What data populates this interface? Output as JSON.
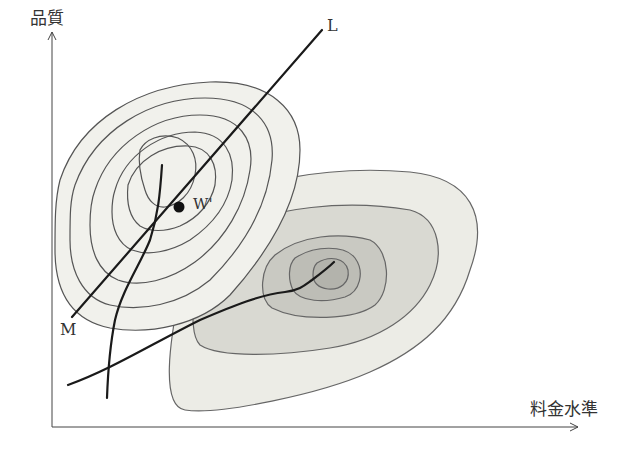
{
  "diagram": {
    "type": "contour-diagram",
    "axes": {
      "y_label": "品質",
      "x_label": "料金水準"
    },
    "lines": [
      {
        "label": "L",
        "kind": "straight line"
      },
      {
        "label": "M",
        "kind": "straight line endpoint label"
      }
    ],
    "point": {
      "label": "W'"
    },
    "regions": [
      {
        "name": "upper-left hill",
        "contour_count": 7
      },
      {
        "name": "lower-right hill",
        "contour_count": 4,
        "shaded": true
      }
    ],
    "colors": {
      "ink": "#1a1a1a",
      "contour": "#555555",
      "fill_light": "#ececE6",
      "fill_mid": "#d9d9d2",
      "fill_dark": "#c4c4bd",
      "fill_core": "#b3b3ac"
    }
  }
}
